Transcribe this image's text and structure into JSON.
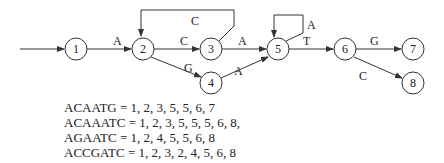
{
  "diagram": {
    "nodes": [
      {
        "id": "1",
        "label": "1",
        "x": 76,
        "y": 49
      },
      {
        "id": "2",
        "label": "2",
        "x": 143,
        "y": 49
      },
      {
        "id": "3",
        "label": "3",
        "x": 211,
        "y": 49
      },
      {
        "id": "4",
        "label": "4",
        "x": 211,
        "y": 83
      },
      {
        "id": "5",
        "label": "5",
        "x": 278,
        "y": 49
      },
      {
        "id": "6",
        "label": "6",
        "x": 345,
        "y": 49
      },
      {
        "id": "7",
        "label": "7",
        "x": 413,
        "y": 49
      },
      {
        "id": "8",
        "label": "8",
        "x": 413,
        "y": 83
      }
    ],
    "edges": [
      {
        "from": "start",
        "to": "1",
        "label": ""
      },
      {
        "from": "1",
        "to": "2",
        "label": "A"
      },
      {
        "from": "2",
        "to": "3",
        "label": "C"
      },
      {
        "from": "3",
        "to": "2",
        "label": "C"
      },
      {
        "from": "2",
        "to": "4",
        "label": "G"
      },
      {
        "from": "3",
        "to": "5",
        "label": "A"
      },
      {
        "from": "4",
        "to": "5",
        "label": "A"
      },
      {
        "from": "5",
        "to": "5",
        "label": "A"
      },
      {
        "from": "5",
        "to": "6",
        "label": "T"
      },
      {
        "from": "6",
        "to": "7",
        "label": "G"
      },
      {
        "from": "6",
        "to": "8",
        "label": "C"
      }
    ]
  },
  "sequences": [
    "ACAATG = 1, 2, 3, 5, 5, 6, 7",
    "ACAAATC = 1, 2, 3, 5, 5, 5, 6, 8,",
    "AGAATC = 1, 2, 4, 5, 5, 6, 8",
    "ACCGATC = 1, 2, 3, 2, 4, 5, 6, 8"
  ]
}
